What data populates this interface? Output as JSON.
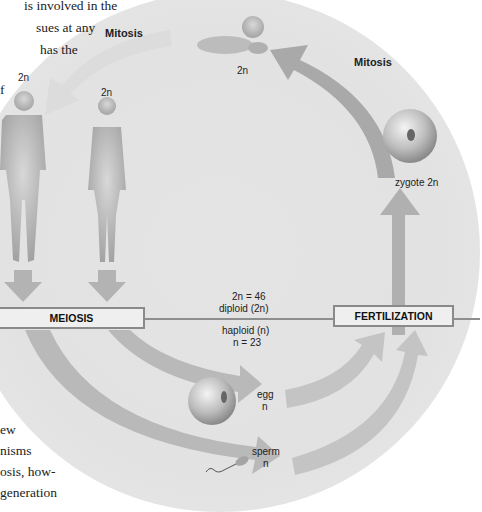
{
  "body_text": {
    "top_lines": [
      "is involved in the",
      "sues at any",
      "has the",
      "f"
    ],
    "bottom_lines": [
      "ew",
      "nisms",
      "osis, how-",
      "generation"
    ]
  },
  "diagram": {
    "mitosis_top_label": "Mitosis",
    "mitosis_right_label": "Mitosis",
    "baby_label": "2n",
    "male_label": "2n",
    "female_label": "2n",
    "zygote_label": "zygote 2n",
    "meiosis_box": "MEIOSIS",
    "fertilization_box": "FERTILIZATION",
    "diploid_count": "2n = 46",
    "diploid_label": "diploid (2n)",
    "haploid_label": "haploid (n)",
    "haploid_count": "n = 23",
    "egg_label": "egg",
    "egg_ploidy": "n",
    "sperm_label": "sperm",
    "sperm_ploidy": "n"
  },
  "colors": {
    "background_disc": "#e3e3e3",
    "arrow": "#a9a9a9",
    "box_border": "#8a8a8a",
    "box_fill": "#efefef",
    "divider": "#8e8e8e"
  }
}
